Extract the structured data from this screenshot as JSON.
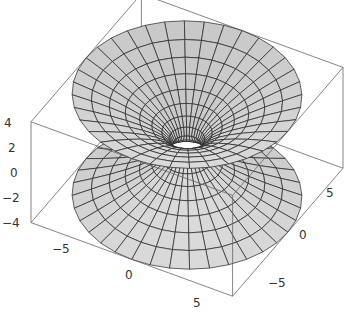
{
  "chart_data": {
    "type": "surface3d",
    "title": "",
    "xlabel": "",
    "ylabel": "",
    "zlabel": "",
    "xlim": [
      -8,
      8
    ],
    "ylim": [
      -8,
      8
    ],
    "zlim": [
      -4,
      4
    ],
    "neck_radius": 1,
    "rim_radius": 8,
    "mesh": {
      "radial_lines": 36,
      "levels": 16
    },
    "z_ticks": [
      "4",
      "2",
      "0",
      "−2",
      "−4"
    ],
    "x_ticks": [
      "−5",
      "0",
      "5"
    ],
    "y_ticks": [
      "5",
      "0",
      "−5"
    ],
    "colors": {
      "surface": "#dcdcdc",
      "surface_dark": "#c8c8c8",
      "mesh": "#222222",
      "box": "#666666",
      "tick_text": "#333333"
    }
  }
}
